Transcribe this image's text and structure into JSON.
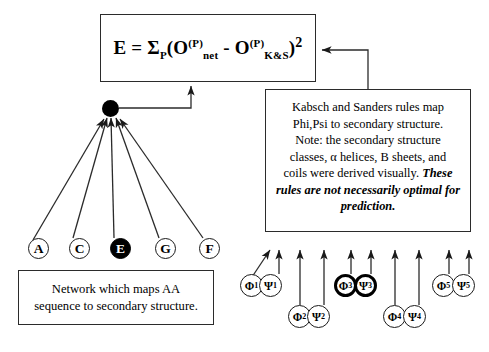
{
  "diagram": {
    "equation_box": {
      "parts": {
        "lhs": "E = ",
        "sigma": "Σ",
        "sigma_sub": "P",
        "open": "(O",
        "sup1": "(P)",
        "sub1": "net",
        "minus": " - O",
        "sup2": "(P)",
        "sub2": "K&S",
        "close": ")",
        "power": "2"
      },
      "plain": "E = ΣP(O(P)net - O(P)K&S)2"
    },
    "rules_box": {
      "line1": "Kabsch and Sanders rules map",
      "line2": "Phi,Psi to secondary structure.",
      "line3": "Note: the secondary structure",
      "line4": "classes, α helices, B sheets, and",
      "line5": "coils were derived visually.",
      "emphasis": "These rules are not necessarily optimal for prediction."
    },
    "network_box": {
      "line1": "Network which maps AA",
      "line2": "sequence to secondary structure."
    },
    "network_output_node": {
      "name": "output-unit",
      "filled": true,
      "color": "#000000"
    },
    "sequence_nodes": [
      {
        "label": "A",
        "filled": false,
        "x": 28,
        "y": 248
      },
      {
        "label": "C",
        "filled": false,
        "x": 70,
        "y": 248
      },
      {
        "label": "E",
        "filled": true,
        "x": 114,
        "y": 248
      },
      {
        "label": "G",
        "filled": false,
        "x": 160,
        "y": 248
      },
      {
        "label": "F",
        "filled": false,
        "x": 205,
        "y": 248
      }
    ],
    "angle_pairs": [
      {
        "index": "1",
        "phi": "Φ",
        "psi": "Ψ",
        "bold": false,
        "phi_x": 249,
        "psi_x": 268,
        "y": 274
      },
      {
        "index": "2",
        "phi": "Φ",
        "psi": "Ψ",
        "bold": false,
        "phi_x": 294,
        "psi_x": 313,
        "y": 305
      },
      {
        "index": "3",
        "phi": "Φ",
        "psi": "Ψ",
        "bold": true,
        "phi_x": 340,
        "psi_x": 360,
        "y": 274
      },
      {
        "index": "4",
        "phi": "Φ",
        "psi": "Ψ",
        "bold": false,
        "phi_x": 389,
        "psi_x": 409,
        "y": 305
      },
      {
        "index": "5",
        "phi": "Φ",
        "psi": "Ψ",
        "bold": true,
        "phi_x": 438,
        "psi_x": 458,
        "y": 274
      }
    ],
    "colors": {
      "ink": "#000000",
      "line": "#2b2b2b",
      "background": "#ffffff"
    }
  }
}
